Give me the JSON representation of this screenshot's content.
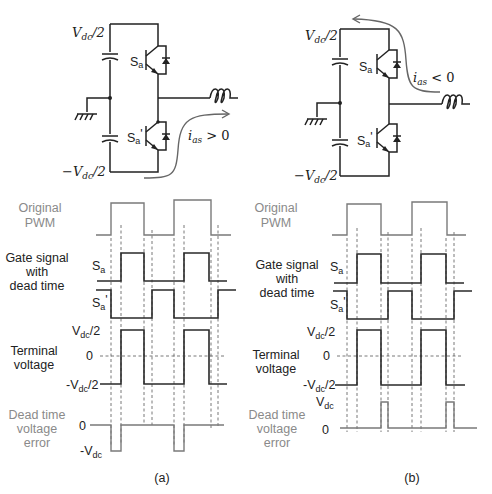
{
  "panels": [
    {
      "id": "a",
      "caption": "(a)",
      "circuit": {
        "top_rail": "V_dc/2",
        "bottom_rail": "-V_dc/2",
        "upper_switch": "Sa",
        "lower_switch": "Sa'",
        "current_label": "i_as > 0",
        "current_direction": "into load via lower device"
      },
      "rows": {
        "original_pwm": {
          "label_line1": "Original",
          "label_line2": "PWM"
        },
        "gate_signal": {
          "label_line1": "Gate signal",
          "label_line2": "with",
          "label_line3": "dead time",
          "sa": "S",
          "sa_sub": "a",
          "sap": "S",
          "sap_sub": "a",
          "sap_prime": "'"
        },
        "terminal": {
          "label_line1": "Terminal",
          "label_line2": "voltage",
          "high": "V",
          "high_sub": "dc",
          "high_tail": "/2",
          "zero": "0",
          "low": "-V",
          "low_sub": "dc",
          "low_tail": "/2"
        },
        "error": {
          "label_line1": "Dead time",
          "label_line2": "voltage",
          "label_line3": "error",
          "zero": "0",
          "level": "-V",
          "level_sub": "dc"
        }
      }
    },
    {
      "id": "b",
      "caption": "(b)",
      "circuit": {
        "top_rail": "V_dc/2",
        "bottom_rail": "-V_dc/2",
        "upper_switch": "Sa",
        "lower_switch": "Sa'",
        "current_label": "i_as < 0",
        "current_direction": "out of load via upper device"
      },
      "rows": {
        "original_pwm": {
          "label_line1": "Original",
          "label_line2": "PWM"
        },
        "gate_signal": {
          "label_line1": "Gate signal",
          "label_line2": "with",
          "label_line3": "dead time",
          "sa": "S",
          "sa_sub": "a",
          "sap": "S",
          "sap_sub": "a",
          "sap_prime": "'"
        },
        "terminal": {
          "label_line1": "Terminal",
          "label_line2": "voltage",
          "high": "V",
          "high_sub": "dc",
          "high_tail": "/2",
          "zero": "0",
          "low": "-V",
          "low_sub": "dc",
          "low_tail": "/2"
        },
        "error": {
          "label_line1": "Dead time",
          "label_line2": "voltage",
          "label_line3": "error",
          "zero": "0",
          "level": "V",
          "level_sub": "dc"
        }
      }
    }
  ],
  "circuit_text": {
    "vdc_half": "V",
    "vdc_sub": "dc",
    "vdc_tail": "/2",
    "neg_vdc": "−V",
    "sa": "S",
    "sa_sub": "a",
    "prime": "'",
    "ias": "i",
    "ias_sub": "as",
    "gt0": " > 0",
    "lt0": " < 0"
  },
  "colors": {
    "signal": "#2a2a2a",
    "gray_label": "#8a8a8a",
    "dead_time_error_trace": "#7a7a7a",
    "current_arrow": "#666666"
  }
}
